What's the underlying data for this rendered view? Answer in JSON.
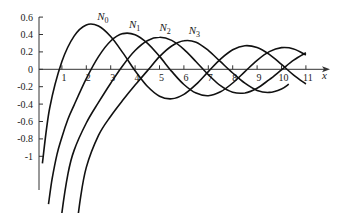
{
  "chart_data": {
    "type": "line",
    "title": "",
    "xlabel": "x",
    "ylabel": "",
    "xlim": [
      0,
      11.8
    ],
    "ylim": [
      -1.5,
      0.6
    ],
    "grid": false,
    "legend": "inline labels near curve maxima",
    "x_ticks": [
      1,
      2,
      3,
      4,
      5,
      6,
      7,
      8,
      9,
      10,
      11
    ],
    "y_ticks": [
      0.6,
      0.4,
      0.2,
      0,
      -0.2,
      -0.4,
      -0.6,
      -0.8,
      -1
    ],
    "y_tick_labels": [
      "0.6",
      "0.4",
      "0.2",
      "0",
      "-0.2",
      "-0.4",
      "-0.6",
      "-0.8",
      "-1"
    ],
    "series": [
      {
        "name": "N0",
        "label_base": "N",
        "label_sub": "0",
        "label_pos": [
          2.45,
          0.57
        ],
        "x": [
          0.2,
          0.5,
          1,
          1.5,
          2,
          2.5,
          3,
          3.5,
          4,
          4.5,
          5,
          5.5,
          6,
          6.5,
          7,
          7.5,
          8,
          8.5,
          9,
          9.5,
          10,
          10.5,
          11
        ],
        "y": [
          -1.081,
          -0.445,
          0.088,
          0.382,
          0.51,
          0.498,
          0.377,
          0.189,
          -0.017,
          -0.195,
          -0.309,
          -0.339,
          -0.288,
          -0.173,
          -0.026,
          0.117,
          0.224,
          0.271,
          0.25,
          0.171,
          0.056,
          -0.067,
          -0.169
        ]
      },
      {
        "name": "N1",
        "label_base": "N",
        "label_sub": "1",
        "label_pos": [
          3.75,
          0.47
        ],
        "x": [
          0.45,
          0.6,
          0.8,
          1,
          1.25,
          1.5,
          2,
          2.5,
          3,
          3.5,
          4,
          4.5,
          5,
          5.5,
          6,
          6.5,
          7,
          7.5,
          8,
          8.5,
          9,
          9.5,
          10,
          10.5,
          11
        ],
        "y": [
          -1.55,
          -1.26,
          -0.978,
          -0.781,
          -0.571,
          -0.412,
          -0.107,
          0.146,
          0.325,
          0.41,
          0.398,
          0.301,
          0.148,
          -0.024,
          -0.175,
          -0.274,
          -0.303,
          -0.259,
          -0.158,
          -0.026,
          0.104,
          0.203,
          0.249,
          0.235,
          0.164
        ]
      },
      {
        "name": "N2",
        "label_base": "N",
        "label_sub": "2",
        "label_pos": [
          5.0,
          0.44
        ],
        "x": [
          0.9,
          1,
          1.25,
          1.5,
          2,
          2.5,
          3,
          3.5,
          4,
          4.5,
          5,
          5.5,
          6,
          6.5,
          7,
          7.5,
          8,
          8.5,
          9,
          9.5,
          10,
          10.5,
          11
        ],
        "y": [
          -1.95,
          -1.651,
          -1.2,
          -0.932,
          -0.617,
          -0.381,
          -0.16,
          0.045,
          0.216,
          0.329,
          0.368,
          0.332,
          0.23,
          0.087,
          -0.061,
          -0.189,
          -0.263,
          -0.272,
          -0.218,
          -0.118,
          -0.006,
          0.105,
          0.19
        ]
      },
      {
        "name": "N3",
        "label_base": "N",
        "label_sub": "3",
        "label_pos": [
          6.2,
          0.41
        ],
        "x": [
          1.55,
          1.75,
          2,
          2.5,
          3,
          3.5,
          4,
          4.5,
          5,
          5.5,
          6,
          6.5,
          7,
          7.5,
          8,
          8.5,
          9,
          9.5,
          10,
          10.3
        ],
        "y": [
          -1.95,
          -1.5,
          -1.128,
          -0.76,
          -0.539,
          -0.354,
          -0.182,
          -0.018,
          0.146,
          0.268,
          0.328,
          0.311,
          0.217,
          0.087,
          -0.043,
          -0.16,
          -0.242,
          -0.266,
          -0.225,
          -0.17
        ]
      }
    ],
    "colors": {
      "line": "#111111",
      "axis": "#333333",
      "text": "#222222"
    }
  }
}
